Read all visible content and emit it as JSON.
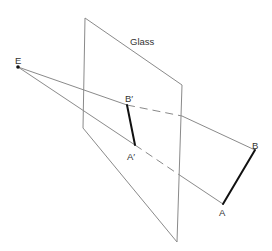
{
  "labels": {
    "glass": "Glass",
    "eye": "E",
    "b_image": "B′",
    "a_image": "A′",
    "b_object": "B",
    "a_object": "A"
  },
  "colors": {
    "construction_line": "#8a8a8a",
    "segment": "#111111",
    "text": "#333333"
  },
  "geometry": {
    "glass_pane": [
      [
        85,
        18
      ],
      [
        182,
        85
      ],
      [
        177,
        242
      ],
      [
        83,
        128
      ]
    ],
    "points": {
      "E": [
        18,
        67
      ],
      "B_prime": [
        127,
        105
      ],
      "A_prime": [
        135,
        145
      ],
      "B": [
        255,
        150
      ],
      "A": [
        223,
        204
      ]
    },
    "glass_back_crossings": {
      "EB": [
        182,
        116
      ],
      "EA": [
        181,
        176
      ]
    }
  }
}
